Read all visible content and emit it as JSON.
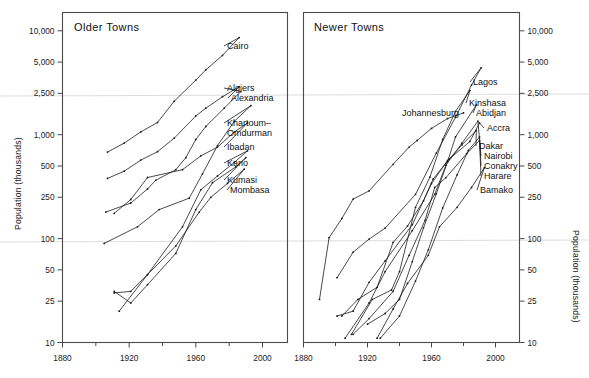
{
  "figure": {
    "width": 589,
    "height": 378,
    "background": "#ffffff",
    "ink": "#1c1c1c"
  },
  "chart_data": [
    {
      "type": "line",
      "title": "Older Towns",
      "xlabel": "",
      "ylabel": "Population (thousands)",
      "xlim": [
        1880,
        2015
      ],
      "ylim": [
        10,
        15000
      ],
      "yscale": "log",
      "grid": false,
      "legend": "inline-labels-right",
      "xticks": [
        1880,
        1920,
        1960,
        2000
      ],
      "xminorticks": [
        1900,
        1940,
        1980
      ],
      "yticks": [
        10,
        25,
        50,
        100,
        250,
        500,
        1000,
        2500,
        5000,
        10000
      ],
      "yticklabels": [
        "10",
        "25",
        "50",
        "100",
        "250",
        "500",
        "1,000",
        "2,500",
        "5,000",
        "10,000"
      ],
      "series": [
        {
          "name": "Cairo",
          "points": [
            [
              1907,
              680
            ],
            [
              1917,
              830
            ],
            [
              1927,
              1065
            ],
            [
              1937,
              1310
            ],
            [
              1947,
              2100
            ],
            [
              1960,
              3350
            ],
            [
              1966,
              4200
            ],
            [
              1976,
              5800
            ],
            [
              1986,
              8600
            ]
          ]
        },
        {
          "name": "Algiers",
          "points": [
            [
              1906,
              180
            ],
            [
              1921,
              220
            ],
            [
              1931,
              300
            ],
            [
              1936,
              365
            ],
            [
              1948,
              460
            ],
            [
              1954,
              600
            ],
            [
              1960,
              900
            ],
            [
              1966,
              1200
            ],
            [
              1977,
              1800
            ],
            [
              1987,
              2600
            ]
          ]
        },
        {
          "name": "Alexandria",
          "points": [
            [
              1907,
              380
            ],
            [
              1917,
              445
            ],
            [
              1927,
              570
            ],
            [
              1937,
              686
            ],
            [
              1947,
              926
            ],
            [
              1960,
              1513
            ],
            [
              1966,
              1800
            ],
            [
              1976,
              2320
            ],
            [
              1986,
              2900
            ]
          ]
        },
        {
          "name": "Khartoum-Omdurman",
          "points": [
            [
              1905,
              90
            ],
            [
              1925,
              130
            ],
            [
              1938,
              190
            ],
            [
              1956,
              245
            ],
            [
              1964,
              420
            ],
            [
              1973,
              785
            ],
            [
              1983,
              1340
            ],
            [
              1993,
              1900
            ]
          ]
        },
        {
          "name": "Ibadan",
          "points": [
            [
              1911,
              175
            ],
            [
              1921,
              238
            ],
            [
              1931,
              387
            ],
            [
              1952,
              460
            ],
            [
              1963,
              625
            ],
            [
              1973,
              760
            ],
            [
              1983,
              1060
            ],
            [
              1991,
              1300
            ]
          ]
        },
        {
          "name": "Kano",
          "points": [
            [
              1911,
              30
            ],
            [
              1921,
              31
            ],
            [
              1931,
              45
            ],
            [
              1952,
              130
            ],
            [
              1963,
              295
            ],
            [
              1973,
              400
            ],
            [
              1983,
              540
            ],
            [
              1991,
              700
            ]
          ]
        },
        {
          "name": "Kumasi",
          "points": [
            [
              1911,
              31
            ],
            [
              1921,
              24
            ],
            [
              1931,
              36
            ],
            [
              1948,
              72
            ],
            [
              1960,
              190
            ],
            [
              1970,
              345
            ],
            [
              1984,
              490
            ],
            [
              1990,
              600
            ]
          ]
        },
        {
          "name": "Mombasa",
          "points": [
            [
              1914,
              20
            ],
            [
              1931,
              45
            ],
            [
              1948,
              85
            ],
            [
              1962,
              180
            ],
            [
              1969,
              250
            ],
            [
              1979,
              340
            ],
            [
              1989,
              465
            ]
          ]
        }
      ]
    },
    {
      "type": "line",
      "title": "Newer Towns",
      "xlabel": "",
      "ylabel": "Population (thousands)",
      "xlim": [
        1880,
        2015
      ],
      "ylim": [
        10,
        15000
      ],
      "yscale": "log",
      "grid": false,
      "legend": "inline-labels-right",
      "xticks": [
        1880,
        1920,
        1960,
        2000
      ],
      "xminorticks": [
        1900,
        1940,
        1980
      ],
      "yticks": [
        10,
        25,
        50,
        100,
        250,
        500,
        1000,
        2500,
        5000,
        10000
      ],
      "yticklabels": [
        "10",
        "25",
        "50",
        "100",
        "250",
        "500",
        "1,000",
        "2,500",
        "5,000",
        "10,000"
      ],
      "series": [
        {
          "name": "Johannesburg",
          "points": [
            [
              1890,
              26
            ],
            [
              1896,
              102
            ],
            [
              1904,
              156
            ],
            [
              1911,
              240
            ],
            [
              1921,
              288
            ],
            [
              1936,
              519
            ],
            [
              1946,
              760
            ],
            [
              1951,
              880
            ],
            [
              1960,
              1150
            ],
            [
              1970,
              1430
            ],
            [
              1980,
              1620
            ]
          ]
        },
        {
          "name": "Lagos",
          "points": [
            [
              1901,
              42
            ],
            [
              1911,
              74
            ],
            [
              1921,
              99
            ],
            [
              1931,
              126
            ],
            [
              1950,
              267
            ],
            [
              1963,
              665
            ],
            [
              1975,
              1470
            ],
            [
              1985,
              3000
            ],
            [
              1991,
              4400
            ]
          ]
        },
        {
          "name": "Kinshasa",
          "points": [
            [
              1910,
              12
            ],
            [
              1923,
              26
            ],
            [
              1935,
              32
            ],
            [
              1940,
              48
            ],
            [
              1950,
              200
            ],
            [
              1959,
              390
            ],
            [
              1967,
              900
            ],
            [
              1975,
              1680
            ],
            [
              1984,
              2660
            ]
          ]
        },
        {
          "name": "Abidjan",
          "points": [
            [
              1920,
              15
            ],
            [
              1931,
              19
            ],
            [
              1940,
              26
            ],
            [
              1948,
              60
            ],
            [
              1955,
              127
            ],
            [
              1963,
              270
            ],
            [
              1970,
              550
            ],
            [
              1975,
              950
            ],
            [
              1988,
              1930
            ]
          ]
        },
        {
          "name": "Accra",
          "points": [
            [
              1901,
              18
            ],
            [
              1911,
              20
            ],
            [
              1921,
              38
            ],
            [
              1931,
              61
            ],
            [
              1948,
              136
            ],
            [
              1960,
              338
            ],
            [
              1970,
              564
            ],
            [
              1984,
              860
            ],
            [
              1990,
              1300
            ]
          ]
        },
        {
          "name": "Dakar",
          "points": [
            [
              1904,
              18
            ],
            [
              1914,
              26
            ],
            [
              1926,
              34
            ],
            [
              1936,
              92
            ],
            [
              1945,
              132
            ],
            [
              1955,
              231
            ],
            [
              1961,
              375
            ],
            [
              1971,
              581
            ],
            [
              1979,
              798
            ],
            [
              1988,
              1100
            ]
          ]
        },
        {
          "name": "Nairobi",
          "points": [
            [
              1906,
              11
            ],
            [
              1921,
              24
            ],
            [
              1931,
              48
            ],
            [
              1948,
              119
            ],
            [
              1962,
              267
            ],
            [
              1969,
              509
            ],
            [
              1979,
              828
            ],
            [
              1989,
              1350
            ]
          ]
        },
        {
          "name": "Conakry",
          "points": [
            [
              1928,
              11
            ],
            [
              1940,
              18
            ],
            [
              1950,
              39
            ],
            [
              1958,
              78
            ],
            [
              1967,
              197
            ],
            [
              1976,
              410
            ],
            [
              1983,
              705
            ],
            [
              1990,
              950
            ]
          ]
        },
        {
          "name": "Harare",
          "points": [
            [
              1911,
              12
            ],
            [
              1921,
              17
            ],
            [
              1936,
              31
            ],
            [
              1946,
              69
            ],
            [
              1956,
              150
            ],
            [
              1962,
              310
            ],
            [
              1969,
              386
            ],
            [
              1982,
              656
            ],
            [
              1990,
              880
            ]
          ]
        },
        {
          "name": "Bamako",
          "points": [
            [
              1926,
              11
            ],
            [
              1936,
              21
            ],
            [
              1945,
              37
            ],
            [
              1958,
              69
            ],
            [
              1965,
              130
            ],
            [
              1976,
              200
            ],
            [
              1985,
              310
            ],
            [
              1993,
              480
            ]
          ]
        }
      ]
    }
  ],
  "panels": {
    "left": {
      "title": "Older Towns",
      "axis_title": "Population (thousands)",
      "y_ticklabels": [
        "10,000",
        "5,000",
        "2,500",
        "1,000",
        "500",
        "250",
        "100",
        "50",
        "25",
        "10"
      ],
      "x_ticklabels": [
        "1880",
        "1920",
        "1960",
        "2000"
      ],
      "city_labels": [
        "Cairo",
        "Algiers",
        "Alexandria",
        "Khartoum–",
        "Omdurman",
        "Ibadan",
        "Kano",
        "Kumasi",
        "Mombasa"
      ]
    },
    "right": {
      "title": "Newer Towns",
      "axis_title": "Population (thousands)",
      "y_ticklabels": [
        "10,000",
        "5,000",
        "2,500",
        "1,000",
        "500",
        "250",
        "100",
        "50",
        "25",
        "10"
      ],
      "x_ticklabels": [
        "1880",
        "1920",
        "1960",
        "2000"
      ],
      "city_labels": [
        "Lagos",
        "Johannesburg",
        "Kinshasa",
        "Abidjan",
        "Accra",
        "Dakar",
        "Nairobi",
        "Conakry",
        "Harare",
        "Bamako"
      ]
    }
  }
}
